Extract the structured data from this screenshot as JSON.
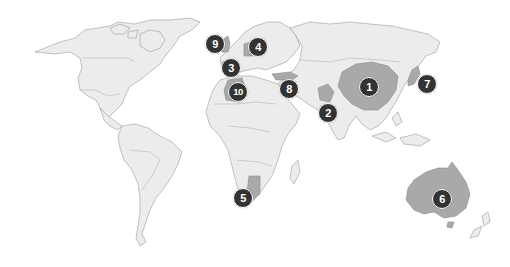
{
  "map": {
    "type": "world-choropleth",
    "colors": {
      "background": "#ffffff",
      "land": "#ececec",
      "highlight": "#a9a9a9",
      "border": "#9a9a9a",
      "marker_fill": "#333333",
      "marker_text": "#ffffff"
    },
    "highlighted_regions": [
      "China",
      "Pakistan",
      "Spain",
      "Germany",
      "Namibia",
      "Australia",
      "Japan",
      "Turkey",
      "United Kingdom",
      "Algeria"
    ],
    "markers": [
      {
        "label": "1",
        "region": "China",
        "x": 369,
        "y": 87
      },
      {
        "label": "2",
        "region": "India / Pakistan",
        "x": 328,
        "y": 113
      },
      {
        "label": "3",
        "region": "Spain",
        "x": 231,
        "y": 68
      },
      {
        "label": "4",
        "region": "Germany / Central Europe",
        "x": 258,
        "y": 47
      },
      {
        "label": "5",
        "region": "Namibia",
        "x": 243,
        "y": 198
      },
      {
        "label": "6",
        "region": "Australia",
        "x": 442,
        "y": 199
      },
      {
        "label": "7",
        "region": "Japan",
        "x": 427,
        "y": 84
      },
      {
        "label": "8",
        "region": "Turkey / Middle East",
        "x": 289,
        "y": 89
      },
      {
        "label": "9",
        "region": "United Kingdom",
        "x": 215,
        "y": 44
      },
      {
        "label": "10",
        "region": "Algeria",
        "x": 238,
        "y": 92
      }
    ]
  }
}
